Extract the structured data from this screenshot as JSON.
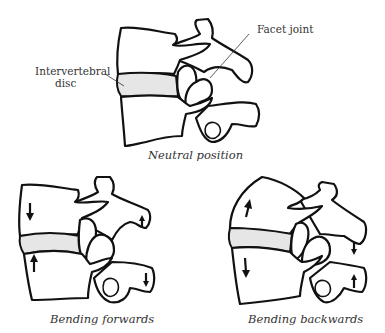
{
  "diagram": {
    "panels": [
      {
        "id": "neutral",
        "caption": "Neutral position"
      },
      {
        "id": "forward",
        "caption": "Bending forwards"
      },
      {
        "id": "backward",
        "caption": "Bending backwards"
      }
    ],
    "labels": {
      "facet_joint": "Facet joint",
      "disc_line1": "Intervertebral",
      "disc_line2": "disc"
    },
    "arrows": {
      "forward": [
        "body-up: down",
        "body-low: up",
        "spinous-up: up",
        "spinous-low: down"
      ],
      "backward": [
        "body-up: up",
        "body-low: down",
        "spinous-up: down",
        "spinous-low: up"
      ]
    },
    "colors": {
      "line": "#111111",
      "disc_fill": "#e6e6e6",
      "text": "#333333"
    }
  }
}
